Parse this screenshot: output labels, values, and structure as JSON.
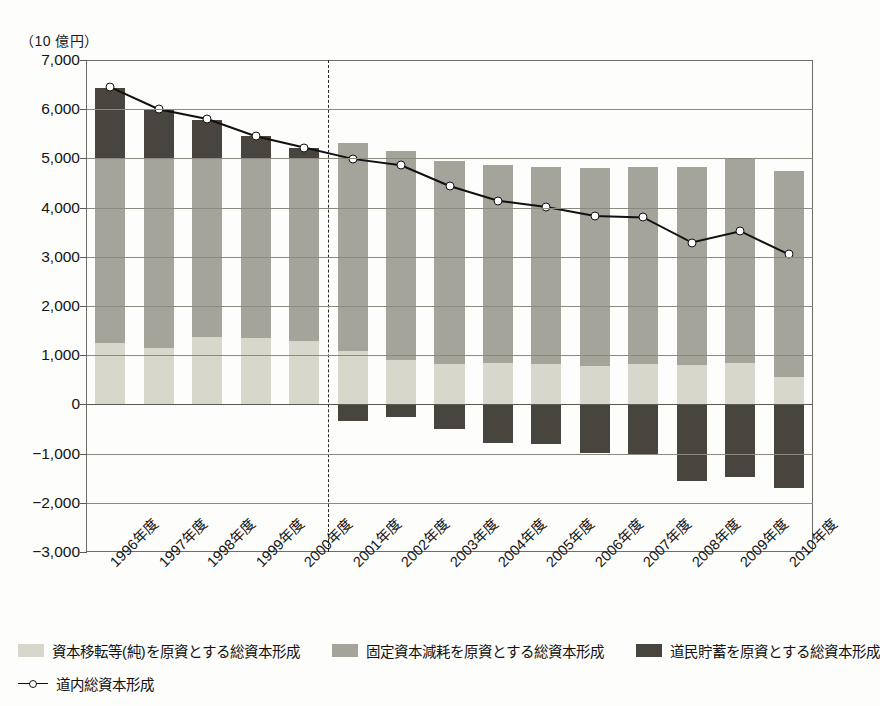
{
  "top_cut_text": "",
  "unit_label": "（10 億円）",
  "chart_data": {
    "type": "bar",
    "title": "",
    "subtitle": "",
    "xlabel": "",
    "ylabel": "（10 億円）",
    "ylim": [
      -3000,
      7000
    ],
    "ytick_step": 1000,
    "grid": true,
    "legend_position": "bottom",
    "stacked": true,
    "categories": [
      "1996年度",
      "1997年度",
      "1998年度",
      "1999年度",
      "2000年度",
      "2001年度",
      "2002年度",
      "2003年度",
      "2004年度",
      "2005年度",
      "2006年度",
      "2007年度",
      "2008年度",
      "2009年度",
      "2010年度"
    ],
    "ytick_labels": [
      "7,000",
      "6,000",
      "5,000",
      "4,000",
      "3,000",
      "2,000",
      "1,000",
      "0",
      "-1,000",
      "-2,000",
      "-3,000"
    ],
    "series": [
      {
        "name": "資本移転等(純)を原資とする総資本形成",
        "color": "#d7d7cc",
        "values": [
          1250,
          1150,
          1380,
          1350,
          1280,
          1080,
          900,
          820,
          850,
          830,
          780,
          820,
          800,
          850,
          560
        ]
      },
      {
        "name": "固定資本減耗を原資とする総資本形成",
        "color": "#a5a49b",
        "values": [
          3740,
          3840,
          3610,
          3660,
          3730,
          4240,
          4260,
          4130,
          4020,
          4000,
          4020,
          4010,
          4030,
          4150,
          4190
        ]
      },
      {
        "name": "道民貯蓄を原資とする総資本形成",
        "color": "#48453f",
        "values": [
          1450,
          1010,
          800,
          440,
          210,
          -330,
          -260,
          -500,
          -780,
          -800,
          -980,
          -1030,
          -1550,
          -1470,
          -1700
        ]
      }
    ],
    "line_series": {
      "name": "道内総資本形成",
      "color": "#111111",
      "marker": "open-circle",
      "values": [
        6450,
        6000,
        5800,
        5450,
        5220,
        4990,
        4860,
        4440,
        4140,
        4010,
        3830,
        3800,
        3290,
        3520,
        3050
      ]
    },
    "annotations": {
      "divider": {
        "type": "vertical-dashed-line",
        "between": [
          "2000年度",
          "2001年度"
        ]
      }
    }
  },
  "legend": {
    "items": [
      {
        "label": "資本移転等(純)を原資とする総資本形成",
        "color": "#d7d7cc"
      },
      {
        "label": "固定資本減耗を原資とする総資本形成",
        "color": "#a5a49b"
      },
      {
        "label": "道民貯蓄を原資とする総資本形成",
        "color": "#48453f"
      }
    ],
    "line_item": {
      "label": "道内総資本形成",
      "color": "#111111"
    }
  }
}
